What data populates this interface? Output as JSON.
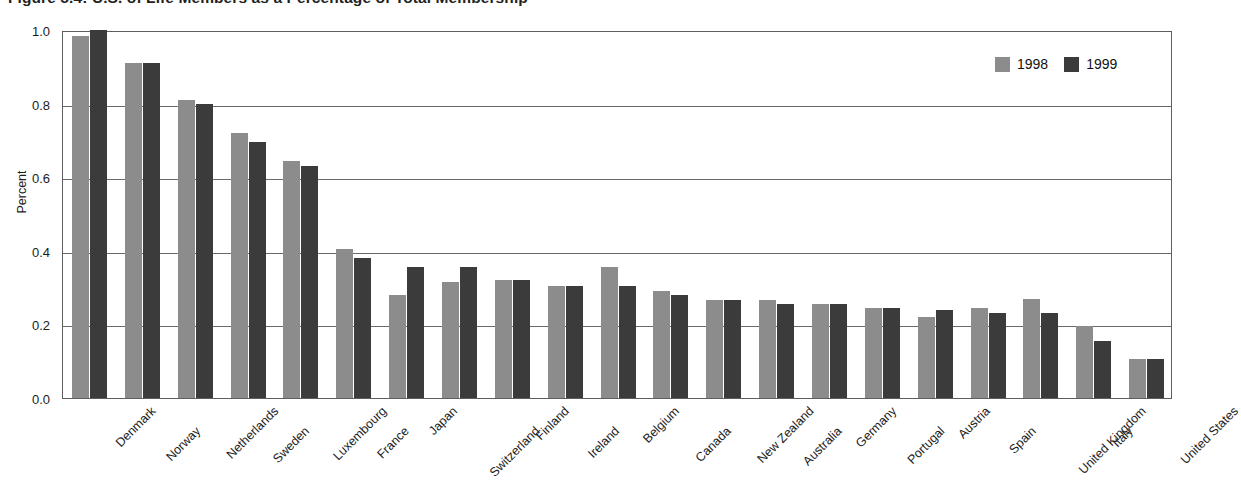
{
  "figure": {
    "title": "Figure 5.4: U.S. of Life Members as a Percentage of Total Membership"
  },
  "legend": {
    "position": "top-right",
    "items": [
      {
        "label": "1998",
        "color": "#8c8c8c"
      },
      {
        "label": "1999",
        "color": "#3b3b3b"
      }
    ]
  },
  "axes": {
    "y_title": "Percent",
    "y_ticks": [
      "1.0",
      "0.8",
      "0.6",
      "0.4",
      "0.2",
      "0.0"
    ]
  },
  "chart_data": {
    "type": "bar",
    "title": "Figure 5.4: U.S. of Life Members as a Percentage of Total Membership",
    "xlabel": "",
    "ylabel": "Percent",
    "ylim": [
      0.0,
      1.0
    ],
    "ytick_values": [
      1.0,
      0.8,
      0.6,
      0.4,
      0.2,
      0.0
    ],
    "grid": true,
    "legend_position": "top-right",
    "categories": [
      "Denmark",
      "Norway",
      "Netherlands",
      "Sweden",
      "Luxembourg",
      "France",
      "Japan",
      "Switzerland",
      "Finland",
      "Ireland",
      "Belgium",
      "Canada",
      "New Zealand",
      "Australia",
      "Germany",
      "Portugal",
      "Austria",
      "Spain",
      "United Kingdom",
      "Italy",
      "United States"
    ],
    "series": [
      {
        "name": "1998",
        "color": "#8c8c8c",
        "values": [
          0.985,
          0.91,
          0.81,
          0.72,
          0.645,
          0.405,
          0.28,
          0.315,
          0.32,
          0.305,
          0.355,
          0.29,
          0.265,
          0.265,
          0.255,
          0.245,
          0.22,
          0.245,
          0.27,
          0.195,
          0.105
        ]
      },
      {
        "name": "1999",
        "color": "#3b3b3b",
        "values": [
          1.0,
          0.91,
          0.8,
          0.695,
          0.63,
          0.38,
          0.355,
          0.355,
          0.32,
          0.305,
          0.305,
          0.28,
          0.265,
          0.255,
          0.255,
          0.245,
          0.24,
          0.23,
          0.23,
          0.155,
          0.105
        ]
      }
    ]
  }
}
